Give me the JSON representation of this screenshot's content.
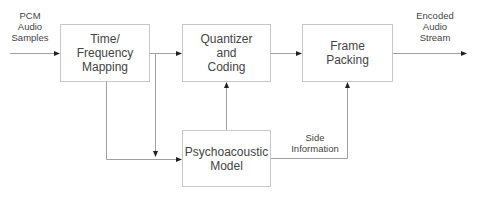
{
  "diagram": {
    "type": "block-diagram",
    "blocks": [
      {
        "id": "tfm",
        "label": "Time/\nFrequency\nMapping"
      },
      {
        "id": "qc",
        "label": "Quantizer\nand\nCoding"
      },
      {
        "id": "fp",
        "label": "Frame\nPacking"
      },
      {
        "id": "pm",
        "label": "Psychoacoustic\nModel"
      }
    ],
    "labels": {
      "input": "PCM\nAudio\nSamples",
      "output": "Encoded\nAudio\nStream",
      "side_info": "Side\nInformation"
    },
    "edges": [
      {
        "from": "input",
        "to": "tfm"
      },
      {
        "from": "tfm",
        "to": "qc"
      },
      {
        "from": "tfm",
        "to": "pm"
      },
      {
        "from": "input",
        "to": "pm"
      },
      {
        "from": "pm",
        "to": "qc"
      },
      {
        "from": "qc",
        "to": "fp"
      },
      {
        "from": "pm",
        "to": "fp",
        "label": "Side Information"
      },
      {
        "from": "fp",
        "to": "output"
      }
    ],
    "colors": {
      "line": "#9a9a9a",
      "box_border": "#c8c8c8",
      "text": "#444444"
    }
  }
}
